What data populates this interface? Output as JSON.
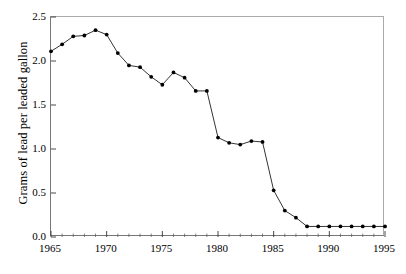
{
  "chart_data": {
    "type": "line",
    "title": "",
    "subtitle": "",
    "xlabel": "",
    "ylabel": "Grams of lead per leaded gallon",
    "xlim": [
      1965,
      1995
    ],
    "ylim": [
      0.0,
      2.5
    ],
    "xticks": [
      1965,
      1970,
      1975,
      1980,
      1985,
      1990,
      1995
    ],
    "xtick_labels": [
      "1965",
      "1970",
      "1975",
      "1980",
      "1985",
      "1990",
      "1995"
    ],
    "yticks": [
      0.0,
      0.5,
      1.0,
      1.5,
      2.0,
      2.5
    ],
    "ytick_labels": [
      "0.0",
      "0.5",
      "1.0",
      "1.5",
      "2.0",
      "2.5"
    ],
    "minor_xtick_interval": 1,
    "grid": false,
    "legend": null,
    "marker": "filled-circle",
    "line_color": "#000000",
    "marker_color": "#000000",
    "x": [
      1965,
      1966,
      1967,
      1968,
      1969,
      1970,
      1971,
      1972,
      1973,
      1974,
      1975,
      1976,
      1977,
      1978,
      1979,
      1980,
      1981,
      1982,
      1983,
      1984,
      1985,
      1986,
      1987,
      1988,
      1989,
      1990,
      1991,
      1992,
      1993,
      1994,
      1995
    ],
    "values": [
      2.11,
      2.19,
      2.28,
      2.29,
      2.35,
      2.3,
      2.09,
      1.95,
      1.93,
      1.82,
      1.73,
      1.87,
      1.81,
      1.66,
      1.66,
      1.13,
      1.07,
      1.05,
      1.09,
      1.08,
      0.53,
      0.3,
      0.22,
      0.12,
      0.12,
      0.12,
      0.12,
      0.12,
      0.12,
      0.12,
      0.12
    ],
    "series": [
      {
        "name": "Grams of lead per leaded gallon",
        "values": [
          2.11,
          2.19,
          2.28,
          2.29,
          2.35,
          2.3,
          2.09,
          1.95,
          1.93,
          1.82,
          1.73,
          1.87,
          1.81,
          1.66,
          1.66,
          1.13,
          1.07,
          1.05,
          1.09,
          1.08,
          0.53,
          0.3,
          0.22,
          0.12,
          0.12,
          0.12,
          0.12,
          0.12,
          0.12,
          0.12,
          0.12
        ]
      }
    ]
  }
}
